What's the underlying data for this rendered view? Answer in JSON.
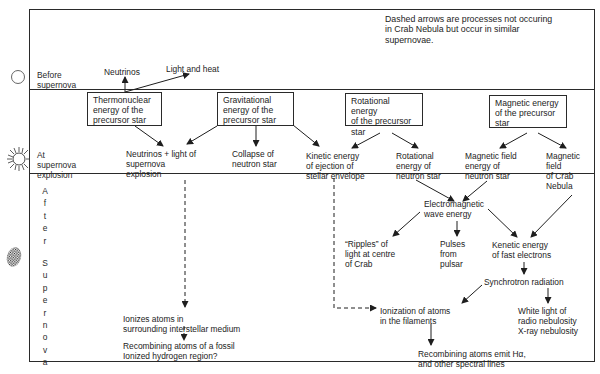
{
  "legend_note": "Dashed arrows are processes not occuring\nin Crab Nebula but occur in similar\nsupernovae.",
  "stages": {
    "before": {
      "label": "Before\nsupernova",
      "icon": "plain-star-circle-icon"
    },
    "during": {
      "label": "At\nsupernova\nexplosion",
      "icon": "exploding-star-icon"
    },
    "after": {
      "label_letters": [
        "A",
        "f",
        "t",
        "e",
        "r",
        "",
        "S",
        "u",
        "p",
        "e",
        "r",
        "n",
        "o",
        "v",
        "a"
      ],
      "icon": "nebula-cloud-icon"
    }
  },
  "before_row": {
    "neutrinos": "Neutrinos",
    "light_heat": "Light and heat"
  },
  "energy_boxes": [
    {
      "id": "thermonuclear",
      "label": "Thermonuclear\nenergy of the\nprecursor star"
    },
    {
      "id": "gravitational",
      "label": "Gravitational\nenergy of the\nprecursor star"
    },
    {
      "id": "rotational",
      "label": "Rotational energy\nof the precursor\nstar"
    },
    {
      "id": "magnetic",
      "label": "Magnetic energy\nof the precursor\nstar"
    }
  ],
  "explosion_row": {
    "neutrinos_light": "Neutrinos + light of\nsupernova\nexplosion",
    "collapse": "Collapse of\nneutron star",
    "kinetic_ejection": "Kinetic energy\nof ejection of\nstellar envelope",
    "rotational_ns": "Rotational\nenergy of\nneutron star",
    "magnetic_ns": "Magnetic field\nenergy of\nneutron star",
    "magnetic_crab": "Magnetic\nfield\nof Crab\nNebula"
  },
  "after_row": {
    "em_wave": "Electromagnetic\nwave energy",
    "ripples": "“Ripples” of\nlight at centre\nof Crab",
    "pulses": "Pulses\nfrom\npulsar",
    "kenetic_electrons": "Kenetic energy\nof fast electrons",
    "synchrotron": "Synchrotron radiation",
    "white_light": "White light of\nradio nebulosity\nX-ray nebulosity",
    "ionization_filaments": "Ionization of atoms\nin the filaments",
    "recombining_halpha": "Recombining atoms emit Hα,\nand other spectral lines",
    "ionizes_ism": "Ionizes atoms in\nsurrounding interstellar medium",
    "recombining_fossil": "Recombining atoms of a fossil\nIonized hydrogen region?"
  },
  "colors": {
    "line": "#2a2a2a",
    "text": "#232323",
    "background": "#ffffff"
  }
}
